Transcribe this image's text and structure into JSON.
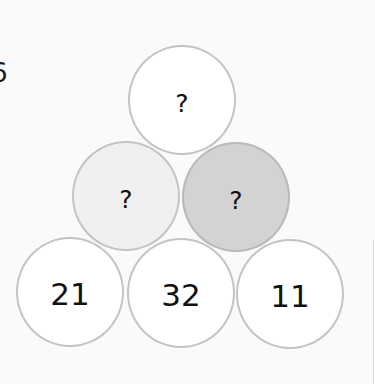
{
  "question_number": "6",
  "pyramid": {
    "top": {
      "label": "?",
      "fill": "#ffffff"
    },
    "middle": [
      {
        "label": "?",
        "fill": "#f0f0f0"
      },
      {
        "label": "?",
        "fill": "#d3d3d3"
      }
    ],
    "bottom": [
      {
        "label": "21",
        "fill": "#ffffff"
      },
      {
        "label": "32",
        "fill": "#ffffff"
      },
      {
        "label": "11",
        "fill": "#ffffff"
      }
    ]
  },
  "colors": {
    "background": "#fafafa",
    "circle_border": "#c4c4c4",
    "text": "#111111"
  }
}
